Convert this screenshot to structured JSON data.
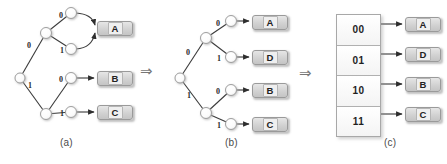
{
  "figure": {
    "background_color": "#ffffff",
    "node_fill": "#fdfdfd",
    "node_stroke": "#9e9e9e",
    "edge_color": "#3a3a3a",
    "box_fill": "#d8d8d8",
    "box_stroke": "#9a9a9a"
  },
  "transform_arrows": [
    {
      "glyph": "⇒",
      "name": "implication-arrow-a-to-b"
    },
    {
      "glyph": "⇒",
      "name": "implication-arrow-b-to-c"
    }
  ],
  "panels": [
    {
      "id": "a",
      "caption": "(a)",
      "type": "tree",
      "description": "Binary code tree where two distinct paths both lead to symbol A",
      "edge_labels": [
        "0",
        "0",
        "1",
        "1",
        "0",
        "1"
      ],
      "leaves": [
        {
          "label": "A",
          "code_paths": [
            "00",
            "01"
          ]
        },
        {
          "label": "B",
          "code_paths": [
            "10"
          ]
        },
        {
          "label": "C",
          "code_paths": [
            "11"
          ]
        }
      ]
    },
    {
      "id": "b",
      "caption": "(b)",
      "type": "tree",
      "description": "Full binary tree with four distinct leaves",
      "edge_labels": [
        "0",
        "0",
        "1",
        "1",
        "0",
        "1"
      ],
      "leaves": [
        {
          "label": "A",
          "code": "00"
        },
        {
          "label": "D",
          "code": "01"
        },
        {
          "label": "B",
          "code": "10"
        },
        {
          "label": "C",
          "code": "11"
        }
      ]
    },
    {
      "id": "c",
      "caption": "(c)",
      "type": "lookup-table",
      "description": "Flat lookup table mapping two-bit codes to symbols",
      "rows": [
        {
          "code": "00",
          "symbol": "A"
        },
        {
          "code": "01",
          "symbol": "D"
        },
        {
          "code": "10",
          "symbol": "B"
        },
        {
          "code": "11",
          "symbol": "C"
        }
      ]
    }
  ],
  "panel_a": {
    "edges": [
      {
        "label": "0",
        "x": 27,
        "y": 42
      },
      {
        "label": "1",
        "x": 28,
        "y": 82
      },
      {
        "label": "0",
        "x": 59,
        "y": 12
      },
      {
        "label": "1",
        "x": 60,
        "y": 47
      },
      {
        "label": "0",
        "x": 59,
        "y": 76
      },
      {
        "label": "1",
        "x": 60,
        "y": 110
      }
    ],
    "leaf_boxes": [
      {
        "label": "A",
        "x": 97,
        "y": 21,
        "w": 34,
        "h": 13
      },
      {
        "label": "B",
        "x": 97,
        "y": 71,
        "w": 34,
        "h": 13
      },
      {
        "label": "C",
        "x": 97,
        "y": 105,
        "w": 34,
        "h": 13
      }
    ],
    "caption_pos": {
      "x": 60,
      "y": 138
    }
  },
  "panel_b": {
    "edges": [
      {
        "label": "0",
        "x": 186,
        "y": 49
      },
      {
        "label": "1",
        "x": 187,
        "y": 92
      },
      {
        "label": "0",
        "x": 216,
        "y": 20
      },
      {
        "label": "1",
        "x": 217,
        "y": 55
      },
      {
        "label": "0",
        "x": 216,
        "y": 88
      },
      {
        "label": "1",
        "x": 217,
        "y": 122
      }
    ],
    "leaf_boxes": [
      {
        "label": "A",
        "x": 252,
        "y": 15,
        "w": 34,
        "h": 13
      },
      {
        "label": "D",
        "x": 252,
        "y": 50,
        "w": 34,
        "h": 13
      },
      {
        "label": "B",
        "x": 252,
        "y": 83,
        "w": 34,
        "h": 13
      },
      {
        "label": "C",
        "x": 252,
        "y": 117,
        "w": 34,
        "h": 13
      }
    ],
    "caption_pos": {
      "x": 225,
      "y": 138
    }
  },
  "panel_c": {
    "table": {
      "x": 336,
      "y": 14,
      "w": 43,
      "h": 121
    },
    "leaf_boxes": [
      {
        "label": "A",
        "x": 405,
        "y": 17,
        "w": 34,
        "h": 13
      },
      {
        "label": "D",
        "x": 405,
        "y": 47,
        "w": 34,
        "h": 13
      },
      {
        "label": "B",
        "x": 405,
        "y": 77,
        "w": 34,
        "h": 13
      },
      {
        "label": "C",
        "x": 405,
        "y": 107,
        "w": 34,
        "h": 13
      }
    ],
    "caption_pos": {
      "x": 384,
      "y": 138
    }
  }
}
